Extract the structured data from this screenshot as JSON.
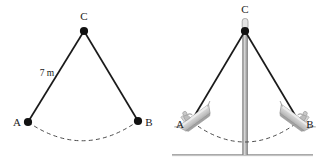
{
  "figure": {
    "title_visible": "",
    "background_color": "#ffffff",
    "ink_color": "#1a1a1a",
    "dashed_color": "#555555",
    "boat_color": "#c9c9c9",
    "pole_color": "#9a9a9a",
    "ground_color": "#808080",
    "panels": [
      {
        "id": "left-panel",
        "name": "geometric-pendulum-diagram",
        "points": [
          {
            "id": "C",
            "label": "C",
            "x": 84,
            "y": 31,
            "label_x": 84,
            "label_y": 20
          },
          {
            "id": "A",
            "label": "A",
            "x": 28,
            "y": 122,
            "label_x": 17,
            "label_y": 126
          },
          {
            "id": "B",
            "label": "B",
            "x": 138,
            "y": 121,
            "label_x": 149,
            "label_y": 126
          }
        ],
        "segments": [
          {
            "id": "CA",
            "from": "C",
            "to": "A",
            "length_label": "7 m"
          },
          {
            "id": "CB",
            "from": "C",
            "to": "B",
            "length_label": ""
          }
        ],
        "length_label": "7 m",
        "length_label_x": 47,
        "length_label_y": 76,
        "arc": {
          "id": "swing-arc",
          "style": "dashed",
          "from_x": 28,
          "from_y": 122,
          "to_x": 138,
          "to_y": 121,
          "sag_y": 141
        }
      },
      {
        "id": "right-panel",
        "name": "swing-ride-illustration",
        "points": [
          {
            "id": "C",
            "label": "C",
            "x": 245,
            "y": 31,
            "label_x": 245,
            "label_y": 13
          },
          {
            "id": "A",
            "label": "A",
            "x": 192,
            "y": 118,
            "label_x": 180,
            "label_y": 127
          },
          {
            "id": "B",
            "label": "B",
            "x": 298,
            "y": 118,
            "label_x": 309,
            "label_y": 127
          }
        ],
        "segments": [
          {
            "id": "CA",
            "from": "C",
            "to": "A"
          },
          {
            "id": "CB",
            "from": "C",
            "to": "B"
          }
        ],
        "arc": {
          "id": "swing-arc",
          "style": "dashed",
          "from_x": 192,
          "from_y": 122,
          "to_x": 298,
          "to_y": 122,
          "sag_y": 142
        },
        "pole": {
          "id": "support-pole",
          "x": 245,
          "top_y": 31,
          "bottom_y": 155
        },
        "ground": {
          "id": "ground-line",
          "x1": 172,
          "x2": 313,
          "y": 155
        },
        "pivot_cap": {
          "id": "pivot-cap",
          "x": 245,
          "y": 24
        },
        "boats": [
          {
            "id": "boat-left",
            "name": "swing-boat-left",
            "cx": 196,
            "cy": 118,
            "rotation": -38
          },
          {
            "id": "boat-right",
            "name": "swing-boat-right",
            "cx": 294,
            "cy": 118,
            "rotation": 38
          }
        ]
      }
    ]
  }
}
